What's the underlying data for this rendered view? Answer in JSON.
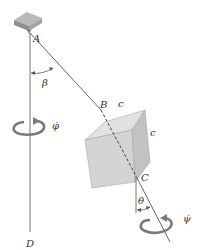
{
  "figure": {
    "labels": {
      "A": "A",
      "B": "B",
      "C": "C",
      "D": "D",
      "edge_c_top": "c",
      "edge_c_side": "c",
      "beta": "β",
      "theta": "θ",
      "phi_dot": "φ̇",
      "psi_dot": "ψ̇"
    },
    "colors": {
      "line": "#666666",
      "block_top": "#b5b5b5",
      "block_side": "#8a8a8a",
      "cube_front": "#d6d6d6",
      "cube_top": "#e3e3e3",
      "cube_side": "#c4c4c4",
      "arrow": "#7a7a7a",
      "text": "#333333"
    }
  }
}
